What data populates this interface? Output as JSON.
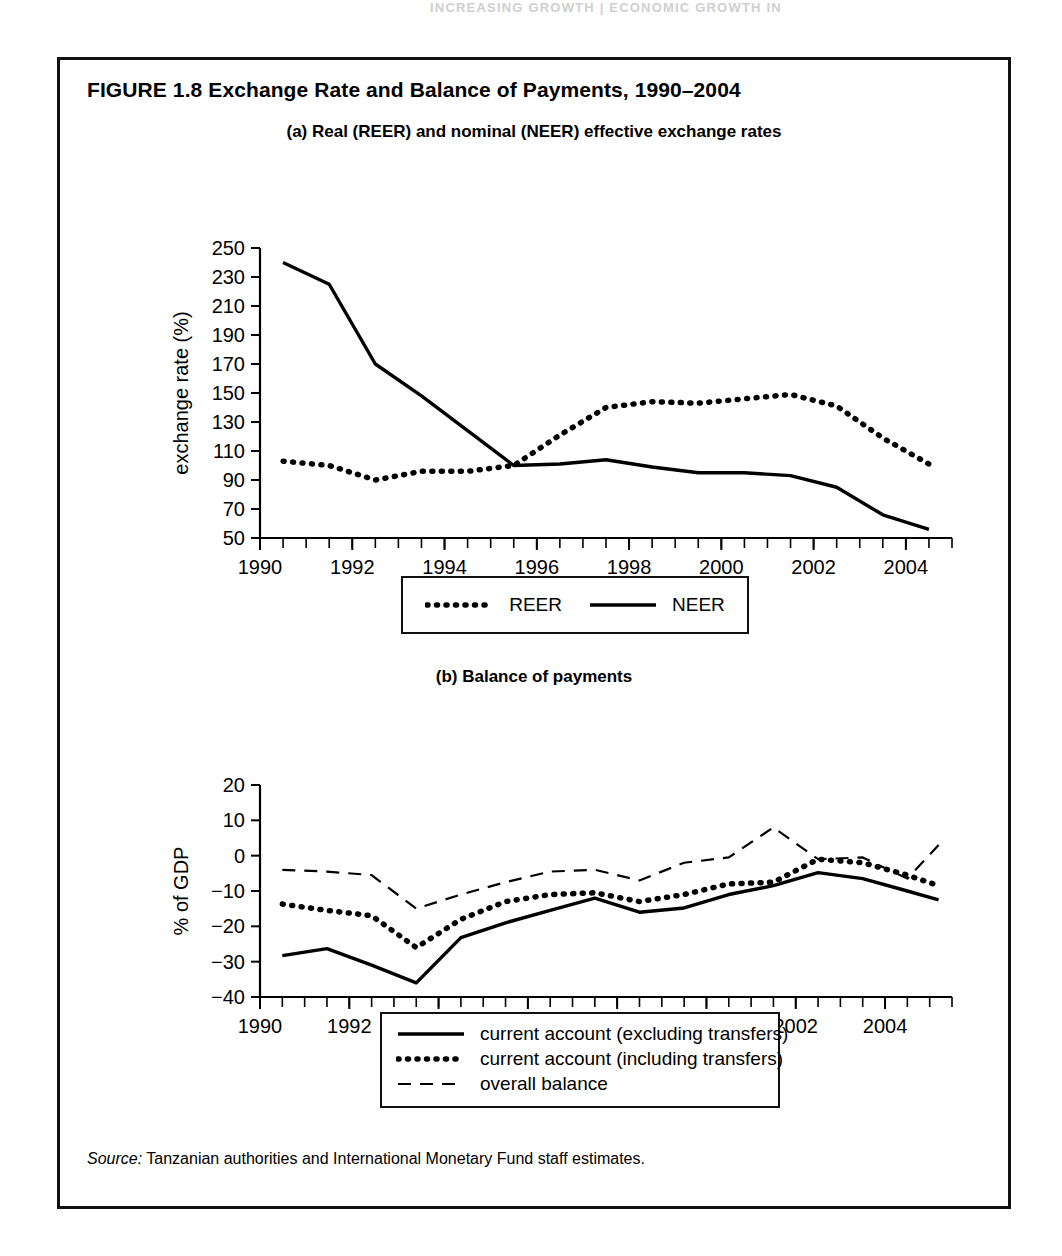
{
  "page_header_ghost": "INCREASING GROWTH  |  ECONOMIC GROWTH IN",
  "figure": {
    "title": "FIGURE 1.8  Exchange Rate and Balance of Payments, 1990–2004",
    "source_prefix": "Source:",
    "source_text": " Tanzanian authorities and International Monetary Fund staff estimates."
  },
  "panel_a": {
    "subtitle": "(a) Real (REER) and nominal (NEER) effective exchange rates",
    "legend": [
      {
        "label": "REER",
        "style": "dotted"
      },
      {
        "label": "NEER",
        "style": "solid"
      }
    ]
  },
  "panel_b": {
    "subtitle": "(b) Balance of payments",
    "legend": [
      {
        "label": "current account (excluding transfers)",
        "style": "solid"
      },
      {
        "label": "current account (including transfers)",
        "style": "dotted"
      },
      {
        "label": "overall balance",
        "style": "dashed"
      }
    ]
  },
  "chart_data": [
    {
      "id": "panel_a",
      "type": "line",
      "title": "(a) Real (REER) and nominal (NEER) effective exchange rates",
      "xlabel": "year",
      "ylabel": "exchange rate (%)",
      "xlim": [
        1990,
        2005
      ],
      "ylim": [
        50,
        250
      ],
      "yticks": [
        50,
        70,
        90,
        110,
        130,
        150,
        170,
        190,
        210,
        230,
        250
      ],
      "xticks": [
        1990,
        1992,
        1994,
        1996,
        1998,
        2000,
        2002,
        2004
      ],
      "xtick_minor_step": 0.5,
      "grid": false,
      "legend_position": "below",
      "series": [
        {
          "name": "NEER",
          "style": "solid",
          "x": [
            1990.5,
            1991.5,
            1992.5,
            1993.5,
            1994.5,
            1995.5,
            1996.5,
            1997.5,
            1998.5,
            1999.5,
            2000.5,
            2001.5,
            2002.5,
            2003.5,
            2004.5
          ],
          "values": [
            240,
            225,
            170,
            148,
            124,
            100,
            101,
            104,
            99,
            95,
            95,
            93,
            85,
            66,
            56
          ]
        },
        {
          "name": "REER",
          "style": "dotted",
          "x": [
            1990.5,
            1991.5,
            1992.5,
            1993.5,
            1994.5,
            1995.5,
            1996.5,
            1997.5,
            1998.5,
            1999.5,
            2000.5,
            2001.5,
            2002.5,
            2003.5,
            2004.5
          ],
          "values": [
            103,
            100,
            90,
            96,
            96,
            100,
            121,
            140,
            144,
            143,
            146,
            149,
            141,
            119,
            101
          ]
        }
      ]
    },
    {
      "id": "panel_b",
      "type": "line",
      "title": "(b) Balance of payments",
      "xlabel": "year",
      "ylabel": "% of GDP",
      "xlim": [
        1990,
        2005.5
      ],
      "ylim": [
        -40,
        20
      ],
      "yticks": [
        -40,
        -30,
        -20,
        -10,
        0,
        10,
        20
      ],
      "ytick_labels": [
        "−40",
        "−30",
        "−20",
        "−10",
        "0",
        "10",
        "20"
      ],
      "xticks": [
        1990,
        1992,
        1994,
        1996,
        1998,
        2000,
        2002,
        2004
      ],
      "xtick_minor_step": 0.5,
      "grid": false,
      "legend_position": "below",
      "series": [
        {
          "name": "current account (excluding transfers)",
          "style": "solid",
          "x": [
            1990.5,
            1991.5,
            1992.5,
            1993.5,
            1994.5,
            1995.5,
            1996.5,
            1997.5,
            1998.5,
            1999.5,
            2000.5,
            2001.5,
            2002.5,
            2003.5,
            2004.5,
            2005.2
          ],
          "values": [
            -28.3,
            -26.3,
            -31.0,
            -36.0,
            -23.2,
            -19.0,
            -15.5,
            -12.0,
            -16.0,
            -14.8,
            -11.0,
            -8.5,
            -4.8,
            -6.5,
            -10.0,
            -12.5
          ]
        },
        {
          "name": "current account (including transfers)",
          "style": "dotted",
          "x": [
            1990.5,
            1991.5,
            1992.5,
            1993.5,
            1994.5,
            1995.5,
            1996.5,
            1997.5,
            1998.5,
            1999.5,
            2000.5,
            2001.5,
            2002.5,
            2003.5,
            2004.5,
            2005.2
          ],
          "values": [
            -13.7,
            -15.5,
            -17.0,
            -26.0,
            -18.0,
            -13.0,
            -11.0,
            -10.5,
            -13.0,
            -11.0,
            -8.0,
            -7.5,
            -1.0,
            -2.0,
            -5.5,
            -8.5
          ]
        },
        {
          "name": "overall balance",
          "style": "dashed",
          "x": [
            1990.5,
            1991.5,
            1992.5,
            1993.5,
            1994.5,
            1995.5,
            1996.5,
            1997.5,
            1998.5,
            1999.5,
            2000.5,
            2001.5,
            2002.5,
            2003.5,
            2004.5,
            2005.2
          ],
          "values": [
            -4.0,
            -4.5,
            -5.5,
            -15.0,
            -11.0,
            -7.5,
            -4.5,
            -4.0,
            -7.0,
            -2.0,
            -0.5,
            8.0,
            -1.0,
            -0.5,
            -6.5,
            3.0
          ]
        }
      ]
    }
  ]
}
